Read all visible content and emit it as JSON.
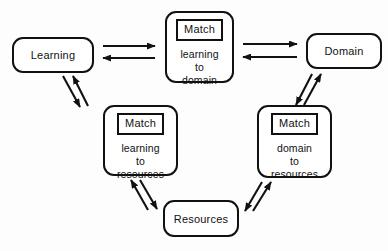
{
  "figure": {
    "title": "",
    "background_color": "#fdfdfd",
    "stroke_color": "#111111"
  },
  "nodes": [
    {
      "id": "learning",
      "type": "simple",
      "label": "Learning",
      "x": 12,
      "y": 37,
      "w": 82,
      "h": 36
    },
    {
      "id": "match-learning-to-domain",
      "type": "match",
      "tag": "Match",
      "line1": "learning",
      "line2": "to",
      "line3": "domain",
      "x": 165,
      "y": 11,
      "w": 69,
      "h": 72
    },
    {
      "id": "domain",
      "type": "simple",
      "label": "Domain",
      "x": 306,
      "y": 33,
      "w": 76,
      "h": 36
    },
    {
      "id": "match-learning-to-resources",
      "type": "match",
      "tag": "Match",
      "line1": "learning",
      "line2": "to",
      "line3": "resources",
      "x": 103,
      "y": 105,
      "w": 75,
      "h": 71
    },
    {
      "id": "match-domain-to-resources",
      "type": "match",
      "tag": "Match",
      "line1": "domain",
      "line2": "to",
      "line3": "resources",
      "x": 257,
      "y": 105,
      "w": 75,
      "h": 73
    },
    {
      "id": "resources",
      "type": "simple",
      "label": "Resources",
      "x": 163,
      "y": 200,
      "w": 76,
      "h": 37
    }
  ],
  "edges": [
    {
      "id": "learning-to-match-domain",
      "from": "learning",
      "to": "match-learning-to-domain",
      "direction": "right",
      "style": "horizontal"
    },
    {
      "id": "match-domain-to-learning",
      "from": "match-learning-to-domain",
      "to": "learning",
      "direction": "left",
      "style": "horizontal"
    },
    {
      "id": "match-domain-to-domain",
      "from": "match-learning-to-domain",
      "to": "domain",
      "direction": "right",
      "style": "horizontal"
    },
    {
      "id": "domain-to-match-domain",
      "from": "domain",
      "to": "match-learning-to-domain",
      "direction": "left",
      "style": "horizontal"
    },
    {
      "id": "learning-to-match-resources",
      "from": "learning",
      "to": "match-learning-to-resources",
      "direction": "down-right",
      "style": "diagonal"
    },
    {
      "id": "match-resources-to-learning",
      "from": "match-learning-to-resources",
      "to": "learning",
      "direction": "up-left",
      "style": "diagonal"
    },
    {
      "id": "match-resources-to-resources",
      "from": "match-learning-to-resources",
      "to": "resources",
      "direction": "down-right",
      "style": "diagonal"
    },
    {
      "id": "resources-to-match-resources",
      "from": "resources",
      "to": "match-learning-to-resources",
      "direction": "up-left",
      "style": "diagonal"
    },
    {
      "id": "resources-to-match-domain-resources",
      "from": "resources",
      "to": "match-domain-to-resources",
      "direction": "up-right",
      "style": "diagonal"
    },
    {
      "id": "match-domain-resources-to-resources",
      "from": "match-domain-to-resources",
      "to": "resources",
      "direction": "down-left",
      "style": "diagonal"
    },
    {
      "id": "match-domain-resources-to-domain",
      "from": "match-domain-to-resources",
      "to": "domain",
      "direction": "up-right",
      "style": "diagonal"
    },
    {
      "id": "domain-to-match-domain-resources",
      "from": "domain",
      "to": "match-domain-to-resources",
      "direction": "down-left",
      "style": "diagonal"
    }
  ]
}
